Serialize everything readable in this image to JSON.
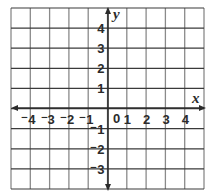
{
  "figure": {
    "type": "coordinate-plane",
    "axes": {
      "x_label": "x",
      "y_label": "y",
      "origin_label": "0"
    },
    "x_ticks": [
      {
        "value": -4,
        "label": "⁻4"
      },
      {
        "value": -3,
        "label": "⁻3"
      },
      {
        "value": -2,
        "label": "⁻2"
      },
      {
        "value": -1,
        "label": "⁻1"
      },
      {
        "value": 1,
        "label": "1"
      },
      {
        "value": 2,
        "label": "2"
      },
      {
        "value": 3,
        "label": "3"
      },
      {
        "value": 4,
        "label": "4"
      }
    ],
    "y_ticks": [
      {
        "value": 4,
        "label": "4"
      },
      {
        "value": 3,
        "label": "3"
      },
      {
        "value": 2,
        "label": "2"
      },
      {
        "value": 1,
        "label": "1"
      },
      {
        "value": -1,
        "label": "⁻1"
      },
      {
        "value": -2,
        "label": "⁻2"
      },
      {
        "value": -3,
        "label": "⁻3"
      }
    ],
    "grid": {
      "columns": 10,
      "rows": 9,
      "x_range": [
        -5,
        5
      ],
      "y_range": [
        -4,
        5
      ]
    },
    "colors": {
      "grid_line": "#8a8a8a",
      "axis": "#2b2b2b",
      "text": "#2b2b2b"
    }
  }
}
